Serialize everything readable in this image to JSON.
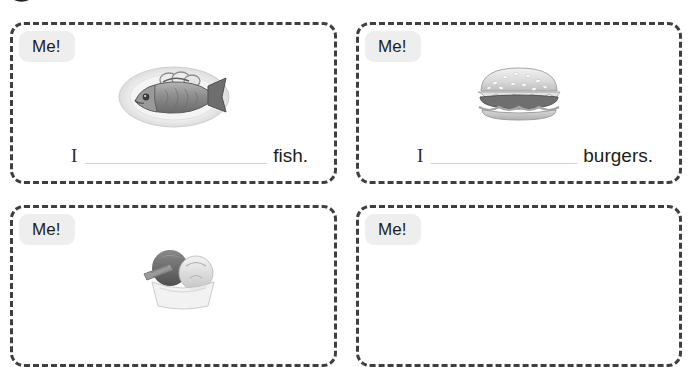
{
  "worksheet": {
    "decoration": {
      "name": "mascot-speech-bubble-icon",
      "color": "#333333"
    },
    "badge_label": "Me!",
    "blank_line_color": "#d3d3d3",
    "card_border_color": "#3f3f3f",
    "badge_background": "#eeeeee",
    "cards": [
      {
        "id": "card-fish",
        "badge": "Me!",
        "image": "fish-on-plate-photo",
        "image_alt": "whole grilled fish on an oval plate with lemon slices",
        "subject": "I",
        "blank": "",
        "object": "fish.",
        "has_image": true,
        "has_sentence": true
      },
      {
        "id": "card-burgers",
        "badge": "Me!",
        "image": "hamburger-photo",
        "image_alt": "hamburger with sesame seed bun",
        "subject": "I",
        "blank": "",
        "object": "burgers.",
        "has_image": true,
        "has_sentence": true
      },
      {
        "id": "card-ice-cream",
        "badge": "Me!",
        "image": "ice-cream-sundae-photo",
        "image_alt": "ice cream sundae in a bowl with a wafer",
        "subject": "",
        "blank": "",
        "object": "",
        "has_image": true,
        "has_sentence": false
      },
      {
        "id": "card-empty",
        "badge": "Me!",
        "image": "",
        "image_alt": "",
        "subject": "",
        "blank": "",
        "object": "",
        "has_image": false,
        "has_sentence": false
      }
    ]
  }
}
